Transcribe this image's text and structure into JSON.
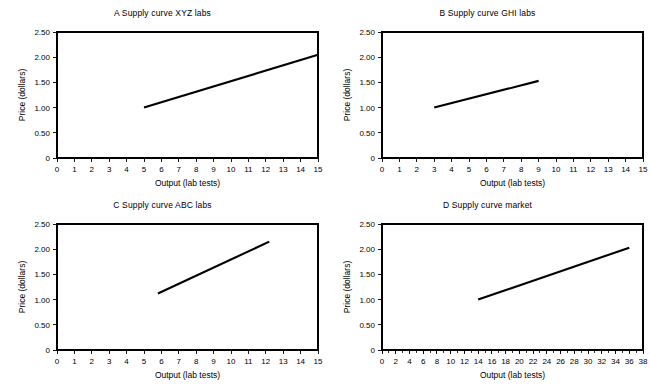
{
  "figure": {
    "background_color": "#ffffff",
    "ink_color": "#000000",
    "panel_count": 4
  },
  "chart_data": [
    {
      "type": "line",
      "panel": "A",
      "title": "A Supply curve XYZ labs",
      "xlabel": "Output (lab tests)",
      "ylabel": "Price (dollars)",
      "xlim": [
        0,
        15
      ],
      "ylim": [
        0,
        2.5
      ],
      "xticks": [
        0,
        1,
        2,
        3,
        4,
        5,
        6,
        7,
        8,
        9,
        10,
        11,
        12,
        13,
        14,
        15
      ],
      "xticklabels": [
        "0",
        "1",
        "2",
        "3",
        "4",
        "5",
        "6",
        "7",
        "8",
        "9",
        "10",
        "11",
        "12",
        "13",
        "14",
        "15"
      ],
      "yticks": [
        0,
        0.5,
        1.0,
        1.5,
        2.0,
        2.5
      ],
      "yticklabels": [
        "0",
        "0.50",
        "1.00",
        "1.50",
        "2.00",
        "2.50"
      ],
      "grid": false,
      "legend": false,
      "series": [
        {
          "name": "Supply curve XYZ labs",
          "x": [
            5,
            15
          ],
          "y": [
            1.0,
            2.05
          ]
        }
      ]
    },
    {
      "type": "line",
      "panel": "B",
      "title": "B Supply curve GHI labs",
      "xlabel": "Output (lab tests)",
      "ylabel": "Price (dollars)",
      "xlim": [
        0,
        15
      ],
      "ylim": [
        0,
        2.5
      ],
      "xticks": [
        0,
        1,
        2,
        3,
        4,
        5,
        6,
        7,
        8,
        9,
        10,
        11,
        12,
        13,
        14,
        15
      ],
      "xticklabels": [
        "0",
        "1",
        "2",
        "3",
        "4",
        "5",
        "6",
        "7",
        "8",
        "9",
        "10",
        "11",
        "12",
        "13",
        "14",
        "15"
      ],
      "yticks": [
        0,
        0.5,
        1.0,
        1.5,
        2.0,
        2.5
      ],
      "yticklabels": [
        "0",
        "0.50",
        "1.00",
        "1.50",
        "2.00",
        "2.50"
      ],
      "grid": false,
      "legend": false,
      "series": [
        {
          "name": "Supply curve GHI labs",
          "x": [
            3,
            9
          ],
          "y": [
            1.0,
            1.53
          ]
        }
      ]
    },
    {
      "type": "line",
      "panel": "C",
      "title": "C Supply curve ABC labs",
      "xlabel": "Output (lab tests)",
      "ylabel": "Price (dollars)",
      "xlim": [
        0,
        15
      ],
      "ylim": [
        0,
        2.5
      ],
      "xticks": [
        0,
        1,
        2,
        3,
        4,
        5,
        6,
        7,
        8,
        9,
        10,
        11,
        12,
        13,
        14,
        15
      ],
      "xticklabels": [
        "0",
        "1",
        "2",
        "3",
        "4",
        "5",
        "6",
        "7",
        "8",
        "9",
        "10",
        "11",
        "12",
        "13",
        "14",
        "15"
      ],
      "yticks": [
        0,
        0.5,
        1.0,
        1.5,
        2.0,
        2.5
      ],
      "yticklabels": [
        "0",
        "0.50",
        "1.00",
        "1.50",
        "2.00",
        "2.50"
      ],
      "grid": false,
      "legend": false,
      "series": [
        {
          "name": "Supply curve ABC labs",
          "x": [
            5.8,
            12.2
          ],
          "y": [
            1.12,
            2.15
          ]
        }
      ]
    },
    {
      "type": "line",
      "panel": "D",
      "title": "D Supply curve market",
      "xlabel": "Output (lab tests)",
      "ylabel": "Price (dollars)",
      "xlim": [
        0,
        38
      ],
      "ylim": [
        0,
        2.5
      ],
      "xticks": [
        0,
        2,
        4,
        6,
        8,
        10,
        12,
        14,
        16,
        18,
        20,
        22,
        24,
        26,
        28,
        30,
        32,
        34,
        36,
        38
      ],
      "xticklabels": [
        "0",
        "2",
        "4",
        "6",
        "8",
        "10",
        "12",
        "14",
        "16",
        "18",
        "20",
        "22",
        "24",
        "26",
        "28",
        "30",
        "32",
        "34",
        "36",
        "38"
      ],
      "xtick_minor_step": 1,
      "yticks": [
        0,
        0.5,
        1.0,
        1.5,
        2.0,
        2.5
      ],
      "yticklabels": [
        "0",
        "0.50",
        "1.00",
        "1.50",
        "2.00",
        "2.50"
      ],
      "grid": false,
      "legend": false,
      "series": [
        {
          "name": "Supply curve market",
          "x": [
            14,
            36
          ],
          "y": [
            1.0,
            2.03
          ]
        }
      ]
    }
  ]
}
